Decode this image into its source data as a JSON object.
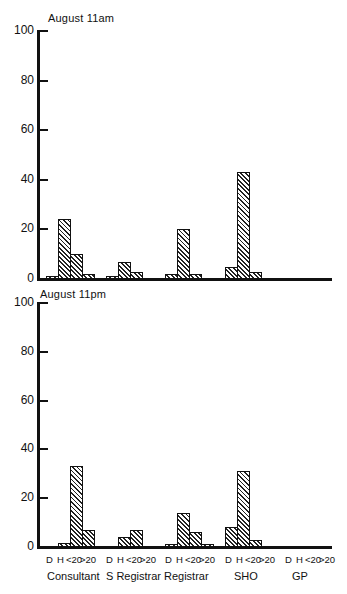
{
  "chart_data": [
    {
      "type": "bar",
      "title": "August 11am",
      "xlabel": "",
      "ylabel": "",
      "ylim": [
        0,
        100
      ],
      "yticks": [
        0,
        20,
        40,
        60,
        80,
        100
      ],
      "groups": [
        "Consultant",
        "S Registrar",
        "Registrar",
        "SHO",
        "GP"
      ],
      "slots": [
        "D",
        "H",
        "<20",
        ">20"
      ],
      "series": [
        {
          "name": "D",
          "values": [
            1,
            1,
            2,
            5,
            0
          ]
        },
        {
          "name": "H",
          "values": [
            24,
            7,
            20,
            43,
            0
          ]
        },
        {
          "name": "<20",
          "values": [
            10,
            3,
            2,
            3,
            0
          ]
        },
        {
          "name": ">20",
          "values": [
            2,
            0,
            0,
            0,
            0
          ]
        }
      ],
      "grid": false,
      "legend": "none"
    },
    {
      "type": "bar",
      "title": "August 11pm",
      "xlabel": "",
      "ylabel": "",
      "ylim": [
        0,
        100
      ],
      "yticks": [
        0,
        20,
        40,
        60,
        80,
        100
      ],
      "groups": [
        "Consultant",
        "S Registrar",
        "Registrar",
        "SHO",
        "GP"
      ],
      "slots": [
        "D",
        "H",
        "<20",
        ">20"
      ],
      "series": [
        {
          "name": "D",
          "values": [
            0,
            0,
            1,
            8,
            0
          ]
        },
        {
          "name": "H",
          "values": [
            1.5,
            4,
            14,
            31,
            0
          ]
        },
        {
          "name": "<20",
          "values": [
            33,
            7,
            6,
            3,
            0
          ]
        },
        {
          "name": ">20",
          "values": [
            7,
            0,
            1,
            0,
            0
          ]
        }
      ],
      "grid": false,
      "legend": "none"
    }
  ],
  "panels": [
    {
      "title": "August 11am"
    },
    {
      "title": "August 11pm"
    }
  ],
  "yticks": [
    "0",
    "20",
    "40",
    "60",
    "80",
    "100"
  ],
  "xaxis": {
    "slot_labels": [
      "D",
      "H",
      "<20",
      ">20"
    ],
    "groups": [
      "Consultant",
      "S Registrar",
      "Registrar",
      "SHO",
      "GP"
    ]
  }
}
